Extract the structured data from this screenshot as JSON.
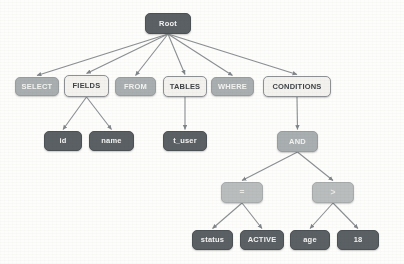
{
  "diagram": {
    "type": "tree",
    "background_color": "#fdfdfb",
    "palette": {
      "dark_node": "#5a6064",
      "mid_node": "#a9aeb0",
      "operator_node": "#b9bdbd",
      "light_node": "#f3f2ef",
      "light_node_border": "#8d9194",
      "edge": "#8a8f92",
      "dark_text": "#3f4346",
      "light_text": "#f4f4f2"
    },
    "nodes": [
      {
        "id": "root",
        "label": "Root",
        "style": "dark",
        "x": 145,
        "y": 13,
        "w": 46,
        "h": 21
      },
      {
        "id": "select",
        "label": "SELECT",
        "style": "mid",
        "x": 15,
        "y": 77,
        "w": 44,
        "h": 19
      },
      {
        "id": "fields",
        "label": "FIELDS",
        "style": "light",
        "x": 64,
        "y": 75,
        "w": 45,
        "h": 22
      },
      {
        "id": "from",
        "label": "FROM",
        "style": "mid",
        "x": 115,
        "y": 77,
        "w": 41,
        "h": 19
      },
      {
        "id": "tables",
        "label": "TABLES",
        "style": "light",
        "x": 163,
        "y": 76,
        "w": 44,
        "h": 21
      },
      {
        "id": "where",
        "label": "WHERE",
        "style": "mid",
        "x": 211,
        "y": 77,
        "w": 43,
        "h": 19
      },
      {
        "id": "conditions",
        "label": "CONDITIONS",
        "style": "light",
        "x": 263,
        "y": 76,
        "w": 68,
        "h": 21
      },
      {
        "id": "id",
        "label": "id",
        "style": "dark",
        "x": 44,
        "y": 131,
        "w": 38,
        "h": 20
      },
      {
        "id": "name",
        "label": "name",
        "style": "dark",
        "x": 89,
        "y": 131,
        "w": 45,
        "h": 20
      },
      {
        "id": "t_user",
        "label": "t_user",
        "style": "dark",
        "x": 163,
        "y": 131,
        "w": 44,
        "h": 20
      },
      {
        "id": "and",
        "label": "AND",
        "style": "mid",
        "x": 277,
        "y": 131,
        "w": 41,
        "h": 21
      },
      {
        "id": "eq",
        "label": "=",
        "style": "op",
        "x": 221,
        "y": 182,
        "w": 42,
        "h": 21
      },
      {
        "id": "gt",
        "label": ">",
        "style": "op",
        "x": 312,
        "y": 182,
        "w": 42,
        "h": 21
      },
      {
        "id": "status",
        "label": "status",
        "style": "dark",
        "x": 192,
        "y": 230,
        "w": 41,
        "h": 20
      },
      {
        "id": "active",
        "label": "ACTIVE",
        "style": "dark",
        "x": 240,
        "y": 230,
        "w": 44,
        "h": 20
      },
      {
        "id": "age",
        "label": "age",
        "style": "dark",
        "x": 290,
        "y": 230,
        "w": 40,
        "h": 20
      },
      {
        "id": "eighteen",
        "label": "18",
        "style": "dark",
        "x": 337,
        "y": 230,
        "w": 42,
        "h": 20
      }
    ],
    "edges": [
      {
        "from": "root",
        "to": "select"
      },
      {
        "from": "root",
        "to": "fields"
      },
      {
        "from": "root",
        "to": "from"
      },
      {
        "from": "root",
        "to": "tables"
      },
      {
        "from": "root",
        "to": "where"
      },
      {
        "from": "root",
        "to": "conditions"
      },
      {
        "from": "fields",
        "to": "id"
      },
      {
        "from": "fields",
        "to": "name"
      },
      {
        "from": "tables",
        "to": "t_user"
      },
      {
        "from": "conditions",
        "to": "and"
      },
      {
        "from": "and",
        "to": "eq"
      },
      {
        "from": "and",
        "to": "gt"
      },
      {
        "from": "eq",
        "to": "status"
      },
      {
        "from": "eq",
        "to": "active"
      },
      {
        "from": "gt",
        "to": "age"
      },
      {
        "from": "gt",
        "to": "eighteen"
      }
    ]
  }
}
